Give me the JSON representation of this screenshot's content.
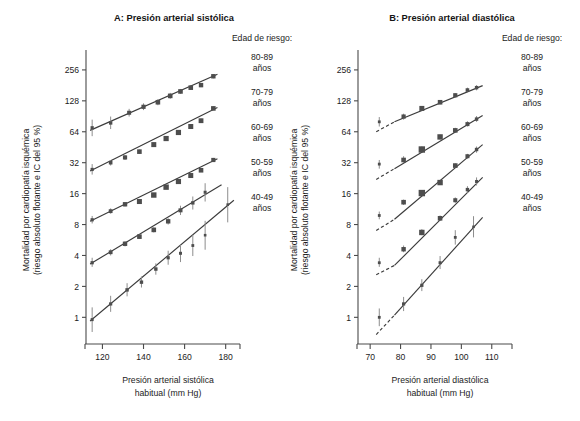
{
  "figure": {
    "width": 580,
    "height": 421,
    "background": "#ffffff",
    "ink_color": "#3b3b3b",
    "marker_color": "#4d4d4d",
    "errorbar_color": "#8d8d8d"
  },
  "panels": {
    "a": {
      "letter_label": "A",
      "title": "A: Presión arterial sistólica",
      "xlabel_line1": "Presión arterial sistólica",
      "xlabel_line2": "habitual (mm Hg)",
      "ylabel_line1": "Mortalidad por cardiopatía isquémica",
      "ylabel_line2": "(riesgo absoluto flotante e IC del 95 %)",
      "legend_title": "Edad de riesgo:"
    },
    "b": {
      "letter_label": "B",
      "title": "B: Presión arterial diastólica",
      "xlabel_line1": "Presión arterial diastólica",
      "xlabel_line2": "habitual (mm Hg)",
      "ylabel_line1": "Mortalidad por cardiopatía isquémica",
      "ylabel_line2": "(riesgo absoluto flotante e IC del 95 %)",
      "legend_title": "Edad de riesgo:"
    }
  },
  "legend_entries": [
    {
      "id": "age-80-89",
      "range": "80-89",
      "unit": "años"
    },
    {
      "id": "age-70-79",
      "range": "70-79",
      "unit": "años"
    },
    {
      "id": "age-60-69",
      "range": "60-69",
      "unit": "años"
    },
    {
      "id": "age-50-59",
      "range": "50-59",
      "unit": "años"
    },
    {
      "id": "age-40-49",
      "range": "40-49",
      "unit": "años"
    }
  ],
  "chart_data": [
    {
      "panel": "A",
      "type": "scatter",
      "title": "A: Presión arterial sistólica",
      "xlabel": "Presión arterial sistólica habitual (mm Hg)",
      "ylabel": "Mortalidad por cardiopatía isquémica (riesgo absoluto flotante e IC del 95 %)",
      "yscale": "log2",
      "ylim": [
        0.55,
        400
      ],
      "yticks": [
        1,
        2,
        4,
        8,
        16,
        32,
        64,
        128,
        256
      ],
      "ytick_labels": [
        "1",
        "2",
        "4",
        "8",
        "16",
        "32",
        "64",
        "128",
        "256"
      ],
      "xlim": [
        112,
        186
      ],
      "xticks": [
        120,
        140,
        160,
        180
      ],
      "xtick_labels": [
        "120",
        "140",
        "160",
        "180"
      ],
      "grid": false,
      "legend_position": "right",
      "series": [
        {
          "name": "80-89 años",
          "x": [
            115,
            124,
            133,
            140,
            147,
            153,
            158,
            163,
            168,
            174
          ],
          "y": [
            70,
            78,
            98,
            112,
            124,
            143,
            158,
            172,
            182,
            222
          ],
          "ci_low": [
            58,
            68,
            90,
            104,
            116,
            134,
            150,
            164,
            174,
            212
          ],
          "ci_high": [
            84,
            90,
            107,
            121,
            133,
            153,
            167,
            181,
            191,
            233
          ],
          "marker_sizes": [
            3.2,
            3.4,
            4.0,
            4.2,
            4.6,
            4.6,
            4.6,
            4.6,
            4.4,
            4.4
          ],
          "fit_x": [
            114,
            176
          ],
          "fit_y": [
            66,
            232
          ]
        },
        {
          "name": "70-79 años",
          "x": [
            115,
            124,
            131,
            138,
            145,
            151,
            157,
            163,
            168,
            174
          ],
          "y": [
            27.5,
            32,
            36,
            41,
            48,
            55,
            63,
            72,
            82,
            108
          ],
          "ci_low": [
            24.5,
            30,
            34,
            39,
            46,
            53,
            61,
            69,
            79,
            104
          ],
          "ci_high": [
            31,
            34,
            38,
            43,
            50,
            58,
            65,
            75,
            86,
            113
          ],
          "marker_sizes": [
            3.2,
            3.6,
            4.2,
            4.6,
            5.0,
            5.2,
            5.2,
            5.0,
            4.8,
            4.6
          ],
          "fit_x": [
            114,
            176
          ],
          "fit_y": [
            26.5,
            110
          ]
        },
        {
          "name": "60-69 años",
          "x": [
            115,
            124,
            131,
            138,
            145,
            151,
            157,
            163,
            168,
            174
          ],
          "y": [
            8.9,
            10.8,
            12.6,
            13.4,
            15.5,
            18.5,
            21,
            24,
            27,
            34
          ],
          "ci_low": [
            8.2,
            10.2,
            12.0,
            12.8,
            14.9,
            17.8,
            20.2,
            23,
            26,
            32.5
          ],
          "ci_high": [
            9.7,
            11.5,
            13.2,
            14.1,
            16.2,
            19.3,
            21.9,
            25,
            28,
            35.6
          ],
          "marker_sizes": [
            3.2,
            3.8,
            4.4,
            5.0,
            5.4,
            5.4,
            5.2,
            5.0,
            4.6,
            4.2
          ],
          "fit_x": [
            114,
            176
          ],
          "fit_y": [
            8.6,
            35
          ]
        },
        {
          "name": "50-59 años",
          "x": [
            115,
            124,
            131,
            138,
            145,
            152,
            158,
            164,
            170
          ],
          "y": [
            3.4,
            4.3,
            5.2,
            6.1,
            7.1,
            8.6,
            11.0,
            13.0,
            16.5
          ],
          "ci_low": [
            3.1,
            4.0,
            4.9,
            5.8,
            6.7,
            8.0,
            9.9,
            11.2,
            13.4
          ],
          "ci_high": [
            3.8,
            4.6,
            5.5,
            6.4,
            7.5,
            9.2,
            12.2,
            15.0,
            20.2
          ],
          "marker_sizes": [
            3.2,
            3.8,
            4.4,
            4.6,
            4.6,
            4.4,
            4.0,
            3.4,
            3.0
          ],
          "fit_x": [
            114,
            178
          ],
          "fit_y": [
            3.3,
            19.5
          ]
        },
        {
          "name": "40-49 años",
          "x": [
            115,
            124,
            132,
            139,
            146,
            152,
            158,
            164,
            170,
            181
          ],
          "y": [
            0.95,
            1.35,
            1.85,
            2.2,
            2.95,
            3.8,
            4.2,
            5.0,
            6.3,
            12.5
          ],
          "ci_low": [
            0.72,
            1.13,
            1.6,
            1.95,
            2.6,
            3.25,
            3.45,
            3.95,
            4.55,
            8.4
          ],
          "ci_high": [
            1.25,
            1.62,
            2.15,
            2.5,
            3.35,
            4.45,
            5.1,
            6.35,
            8.7,
            18.5
          ],
          "marker_sizes": [
            3.0,
            3.2,
            3.4,
            3.4,
            3.4,
            3.2,
            3.0,
            2.8,
            2.6,
            2.6
          ],
          "fit_x": [
            114,
            184
          ],
          "fit_y": [
            0.92,
            13.8
          ]
        }
      ]
    },
    {
      "panel": "B",
      "type": "scatter",
      "title": "B: Presión arterial diastólica",
      "xlabel": "Presión arterial diastólica habitual (mm Hg)",
      "ylabel": "Mortalidad por cardiopatía isquémica (riesgo absoluto flotante e IC del 95 %)",
      "yscale": "log2",
      "ylim": [
        0.55,
        400
      ],
      "yticks": [
        1,
        2,
        4,
        8,
        16,
        32,
        64,
        128,
        256
      ],
      "ytick_labels": [
        "1",
        "2",
        "4",
        "8",
        "16",
        "32",
        "64",
        "128",
        "256"
      ],
      "xlim": [
        66,
        116
      ],
      "xticks": [
        70,
        80,
        90,
        100,
        110
      ],
      "xtick_labels": [
        "70",
        "80",
        "90",
        "100",
        "110"
      ],
      "grid": false,
      "legend_position": "right",
      "series": [
        {
          "name": "80-89 años",
          "x": [
            73,
            81,
            87,
            93,
            98,
            102,
            105
          ],
          "y": [
            80,
            90,
            108,
            124,
            145,
            163,
            172
          ],
          "ci_low": [
            72,
            84,
            102,
            118,
            138,
            154,
            162
          ],
          "ci_high": [
            89,
            96,
            114,
            130,
            152,
            172,
            182
          ],
          "marker_sizes": [
            2.8,
            4.2,
            5.0,
            4.6,
            4.2,
            3.6,
            3.4
          ],
          "fit_x": [
            78,
            107
          ],
          "fit_y": [
            80,
            180
          ],
          "dash_x": [
            72,
            78
          ],
          "dash_y": [
            64,
            80
          ]
        },
        {
          "name": "70-79 años",
          "x": [
            73,
            81,
            87,
            93,
            98,
            102,
            105
          ],
          "y": [
            31,
            34,
            43,
            57,
            66,
            76,
            85
          ],
          "ci_low": [
            28,
            32,
            41,
            54,
            63,
            72,
            80
          ],
          "ci_high": [
            34,
            37,
            46,
            60,
            70,
            81,
            91
          ],
          "marker_sizes": [
            2.8,
            4.6,
            6.4,
            5.4,
            4.6,
            4.0,
            3.4
          ],
          "fit_x": [
            78,
            107
          ],
          "fit_y": [
            28,
            92
          ],
          "dash_x": [
            72,
            78
          ],
          "dash_y": [
            22,
            28
          ]
        },
        {
          "name": "60-69 años",
          "x": [
            73,
            81,
            87,
            93,
            98,
            102,
            105
          ],
          "y": [
            9.8,
            13.2,
            16.2,
            20.5,
            30,
            37,
            43
          ],
          "ci_low": [
            9.0,
            12.4,
            15.3,
            19.4,
            28.5,
            35,
            40
          ],
          "ci_high": [
            10.7,
            14.0,
            17.2,
            21.7,
            31.6,
            39,
            46
          ],
          "marker_sizes": [
            2.8,
            4.6,
            6.4,
            5.4,
            4.6,
            4.0,
            3.4
          ],
          "fit_x": [
            78,
            107
          ],
          "fit_y": [
            9.0,
            48
          ],
          "dash_x": [
            72,
            78
          ],
          "dash_y": [
            7.0,
            9.0
          ]
        },
        {
          "name": "50-59 años",
          "x": [
            73,
            81,
            87,
            93,
            98,
            102,
            105
          ],
          "y": [
            3.4,
            4.6,
            6.7,
            9.2,
            13.8,
            17.5,
            21
          ],
          "ci_low": [
            3.1,
            4.3,
            6.3,
            8.7,
            13.0,
            16.3,
            19.2
          ],
          "ci_high": [
            3.8,
            5.0,
            7.2,
            9.8,
            14.7,
            18.9,
            23.0
          ],
          "marker_sizes": [
            2.8,
            4.4,
            5.4,
            4.6,
            4.0,
            3.4,
            3.0
          ],
          "fit_x": [
            78,
            107
          ],
          "fit_y": [
            3.2,
            23
          ],
          "dash_x": [
            72,
            78
          ],
          "dash_y": [
            2.6,
            3.2
          ]
        },
        {
          "name": "40-49 años",
          "x": [
            73,
            81,
            87,
            93,
            98,
            104
          ],
          "y": [
            1.0,
            1.35,
            2.05,
            3.4,
            6.0,
            7.6
          ],
          "ci_low": [
            0.82,
            1.15,
            1.8,
            2.95,
            5.1,
            6.0
          ],
          "ci_high": [
            1.22,
            1.58,
            2.35,
            3.95,
            7.05,
            9.65
          ],
          "marker_sizes": [
            2.8,
            3.2,
            3.2,
            3.0,
            2.8,
            2.6
          ],
          "fit_x": [
            78,
            107
          ],
          "fit_y": [
            1.05,
            9.4
          ],
          "dash_x": [
            72,
            78
          ],
          "dash_y": [
            0.68,
            1.05
          ]
        }
      ]
    }
  ]
}
